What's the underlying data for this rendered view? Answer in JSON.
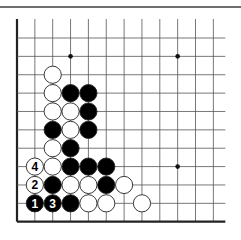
{
  "diagram": {
    "type": "go-problem",
    "grid": {
      "columns": 12,
      "rows": 11,
      "left_x": 17,
      "top_y": 38,
      "col_spacing": 17.85,
      "row_spacing": 18.37,
      "left_edge": true,
      "bottom_edge": true,
      "line_color": "#555555",
      "edge_color": "#222222"
    },
    "star_points": [
      {
        "col": 3,
        "row": 1
      },
      {
        "col": 9,
        "row": 1
      },
      {
        "col": 9,
        "row": 7
      }
    ],
    "stones": [
      {
        "color": "white",
        "col": 2,
        "row": 2
      },
      {
        "color": "white",
        "col": 2,
        "row": 3
      },
      {
        "color": "black",
        "col": 3,
        "row": 3
      },
      {
        "color": "black",
        "col": 4,
        "row": 3
      },
      {
        "color": "white",
        "col": 2,
        "row": 4
      },
      {
        "color": "white",
        "col": 3,
        "row": 4
      },
      {
        "color": "black",
        "col": 4,
        "row": 4
      },
      {
        "color": "black",
        "col": 2,
        "row": 5
      },
      {
        "color": "white",
        "col": 3,
        "row": 5
      },
      {
        "color": "black",
        "col": 4,
        "row": 5
      },
      {
        "color": "white",
        "col": 2,
        "row": 6
      },
      {
        "color": "black",
        "col": 3,
        "row": 6
      },
      {
        "color": "white",
        "col": 1,
        "row": 7,
        "label": "4"
      },
      {
        "color": "white",
        "col": 2,
        "row": 7
      },
      {
        "color": "black",
        "col": 3,
        "row": 7
      },
      {
        "color": "black",
        "col": 4,
        "row": 7
      },
      {
        "color": "black",
        "col": 5,
        "row": 7
      },
      {
        "color": "white",
        "col": 1,
        "row": 8,
        "label": "2"
      },
      {
        "color": "black",
        "col": 2,
        "row": 8
      },
      {
        "color": "white",
        "col": 3,
        "row": 8
      },
      {
        "color": "white",
        "col": 4,
        "row": 8
      },
      {
        "color": "black",
        "col": 5,
        "row": 8
      },
      {
        "color": "white",
        "col": 6,
        "row": 8
      },
      {
        "color": "black",
        "col": 1,
        "row": 9,
        "label": "1"
      },
      {
        "color": "black",
        "col": 2,
        "row": 9,
        "label": "3"
      },
      {
        "color": "black",
        "col": 3,
        "row": 9
      },
      {
        "color": "white",
        "col": 4,
        "row": 9
      },
      {
        "color": "white",
        "col": 5,
        "row": 9
      },
      {
        "color": "white",
        "col": 7,
        "row": 9
      }
    ],
    "colors": {
      "black_stone": "#000000",
      "white_stone": "#ffffff",
      "stone_outline": "#222222",
      "star_point": "#111111"
    }
  }
}
